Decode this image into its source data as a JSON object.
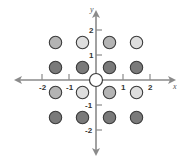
{
  "diagram": {
    "title": "",
    "origin_px": [
      96,
      80
    ],
    "unit_px": {
      "x": 27,
      "y": 25
    },
    "axes": {
      "x_label": "x",
      "y_label": "y",
      "x_ticks": [
        {
          "value": -2,
          "label": "-2"
        },
        {
          "value": -1,
          "label": "-1"
        },
        {
          "value": 1,
          "label": "1"
        },
        {
          "value": 2,
          "label": "2"
        }
      ],
      "y_ticks": [
        {
          "value": 2,
          "label": "2"
        },
        {
          "value": 1,
          "label": "1"
        },
        {
          "value": -1,
          "label": "-1"
        },
        {
          "value": -2,
          "label": "-2"
        }
      ],
      "color": "#8a8a8a"
    },
    "colors": {
      "medium": "#b4b4b4",
      "light": "#dedede",
      "dark": "#7a7a7a",
      "outline": "#3a3a3a",
      "origin_fill": "#ffffff"
    },
    "origin_point": {
      "x": 0,
      "y": 0,
      "shade": "origin"
    },
    "points": [
      {
        "x": -1.5,
        "y": 1.5,
        "shade": "medium"
      },
      {
        "x": -0.5,
        "y": 1.5,
        "shade": "light"
      },
      {
        "x": 0.5,
        "y": 1.5,
        "shade": "medium"
      },
      {
        "x": 1.5,
        "y": 1.5,
        "shade": "light"
      },
      {
        "x": -1.5,
        "y": 0.5,
        "shade": "dark"
      },
      {
        "x": -0.5,
        "y": 0.5,
        "shade": "dark"
      },
      {
        "x": 0.5,
        "y": 0.5,
        "shade": "dark"
      },
      {
        "x": 1.5,
        "y": 0.5,
        "shade": "dark"
      },
      {
        "x": -1.5,
        "y": -0.5,
        "shade": "medium"
      },
      {
        "x": -0.5,
        "y": -0.5,
        "shade": "light"
      },
      {
        "x": 0.5,
        "y": -0.5,
        "shade": "medium"
      },
      {
        "x": 1.5,
        "y": -0.5,
        "shade": "light"
      },
      {
        "x": -1.5,
        "y": -1.5,
        "shade": "dark"
      },
      {
        "x": -0.5,
        "y": -1.5,
        "shade": "dark"
      },
      {
        "x": 0.5,
        "y": -1.5,
        "shade": "dark"
      },
      {
        "x": 1.5,
        "y": -1.5,
        "shade": "dark"
      }
    ]
  }
}
